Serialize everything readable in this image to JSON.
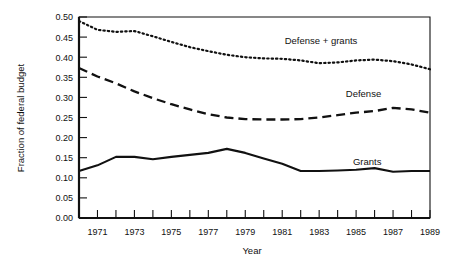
{
  "chart_data": {
    "type": "line",
    "title": "",
    "xlabel": "Year",
    "ylabel": "Fraction of federal budget",
    "xlim": [
      1970,
      1989
    ],
    "ylim": [
      0.0,
      0.5
    ],
    "grid": false,
    "legend_position": "inline-right",
    "x": [
      1970,
      1971,
      1972,
      1973,
      1974,
      1975,
      1976,
      1977,
      1978,
      1979,
      1980,
      1981,
      1982,
      1983,
      1984,
      1985,
      1986,
      1987,
      1988,
      1989
    ],
    "xticklabels": [
      "1971",
      "1973",
      "1975",
      "1977",
      "1979",
      "1981",
      "1983",
      "1985",
      "1987",
      "1989"
    ],
    "xtickvalues": [
      1971,
      1973,
      1975,
      1977,
      1979,
      1981,
      1983,
      1985,
      1987,
      1989
    ],
    "yticklabels": [
      "0.00",
      "0.05",
      "0.10",
      "0.15",
      "0.20",
      "0.25",
      "0.30",
      "0.35",
      "0.40",
      "0.45",
      "0.50"
    ],
    "ytickvalues": [
      0.0,
      0.05,
      0.1,
      0.15,
      0.2,
      0.25,
      0.3,
      0.35,
      0.4,
      0.45,
      0.5
    ],
    "series": [
      {
        "name": "Defense + grants",
        "style": "dotted",
        "label_x": 1983.1,
        "label_y": 0.432,
        "values": [
          0.49,
          0.468,
          0.463,
          0.465,
          0.452,
          0.438,
          0.425,
          0.415,
          0.406,
          0.4,
          0.397,
          0.396,
          0.392,
          0.385,
          0.387,
          0.392,
          0.394,
          0.39,
          0.382,
          0.37
        ]
      },
      {
        "name": "Defense",
        "style": "dashed",
        "label_x": 1985.4,
        "label_y": 0.302,
        "values": [
          0.373,
          0.352,
          0.335,
          0.315,
          0.298,
          0.283,
          0.27,
          0.258,
          0.25,
          0.246,
          0.245,
          0.245,
          0.246,
          0.25,
          0.256,
          0.262,
          0.266,
          0.274,
          0.27,
          0.262
        ]
      },
      {
        "name": "Grants",
        "style": "solid",
        "label_x": 1985.6,
        "label_y": 0.132,
        "values": [
          0.117,
          0.131,
          0.152,
          0.152,
          0.146,
          0.152,
          0.157,
          0.162,
          0.172,
          0.162,
          0.148,
          0.135,
          0.117,
          0.117,
          0.118,
          0.12,
          0.124,
          0.115,
          0.117,
          0.117
        ]
      }
    ]
  },
  "plot": {
    "frame_color": "#111111",
    "background": "#ffffff"
  }
}
